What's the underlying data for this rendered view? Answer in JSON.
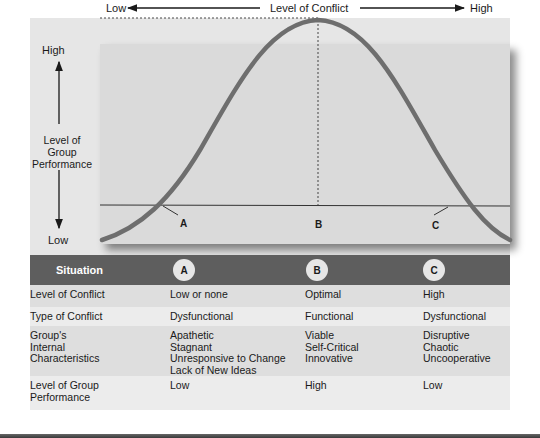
{
  "diagram": {
    "x_axis": {
      "low_label": "Low",
      "title": "Level of Conflict",
      "high_label": "High"
    },
    "y_axis": {
      "high_label": "High",
      "title_line1": "Level of",
      "title_line2": "Group",
      "title_line3": "Performance",
      "low_label": "Low"
    },
    "points": [
      {
        "label": "A"
      },
      {
        "label": "B"
      },
      {
        "label": "C"
      }
    ],
    "colors": {
      "curve": "#6e6e6e",
      "panel": "#e6e6e6",
      "chart_bg": "#dadada",
      "header_bg": "#5e5e5e"
    }
  },
  "table": {
    "header": {
      "situation": "Situation",
      "col_a": "A",
      "col_b": "B",
      "col_c": "C"
    },
    "rows": [
      {
        "label": [
          "Level of Conflict"
        ],
        "a": [
          "Low or none"
        ],
        "b": [
          "Optimal"
        ],
        "c": [
          "High"
        ]
      },
      {
        "label": [
          "Type of Conflict"
        ],
        "a": [
          "Dysfunctional"
        ],
        "b": [
          "Functional"
        ],
        "c": [
          "Dysfunctional"
        ]
      },
      {
        "label": [
          "Group's",
          "Internal",
          "Characteristics"
        ],
        "a": [
          "Apathetic",
          "Stagnant",
          "Unresponsive to Change",
          "Lack of New Ideas"
        ],
        "b": [
          "Viable",
          "Self-Critical",
          "Innovative"
        ],
        "c": [
          "Disruptive",
          "Chaotic",
          "Uncooperative"
        ]
      },
      {
        "label": [
          "Level of Group",
          "Performance"
        ],
        "a": [
          "Low"
        ],
        "b": [
          "High"
        ],
        "c": [
          "Low"
        ]
      }
    ]
  }
}
